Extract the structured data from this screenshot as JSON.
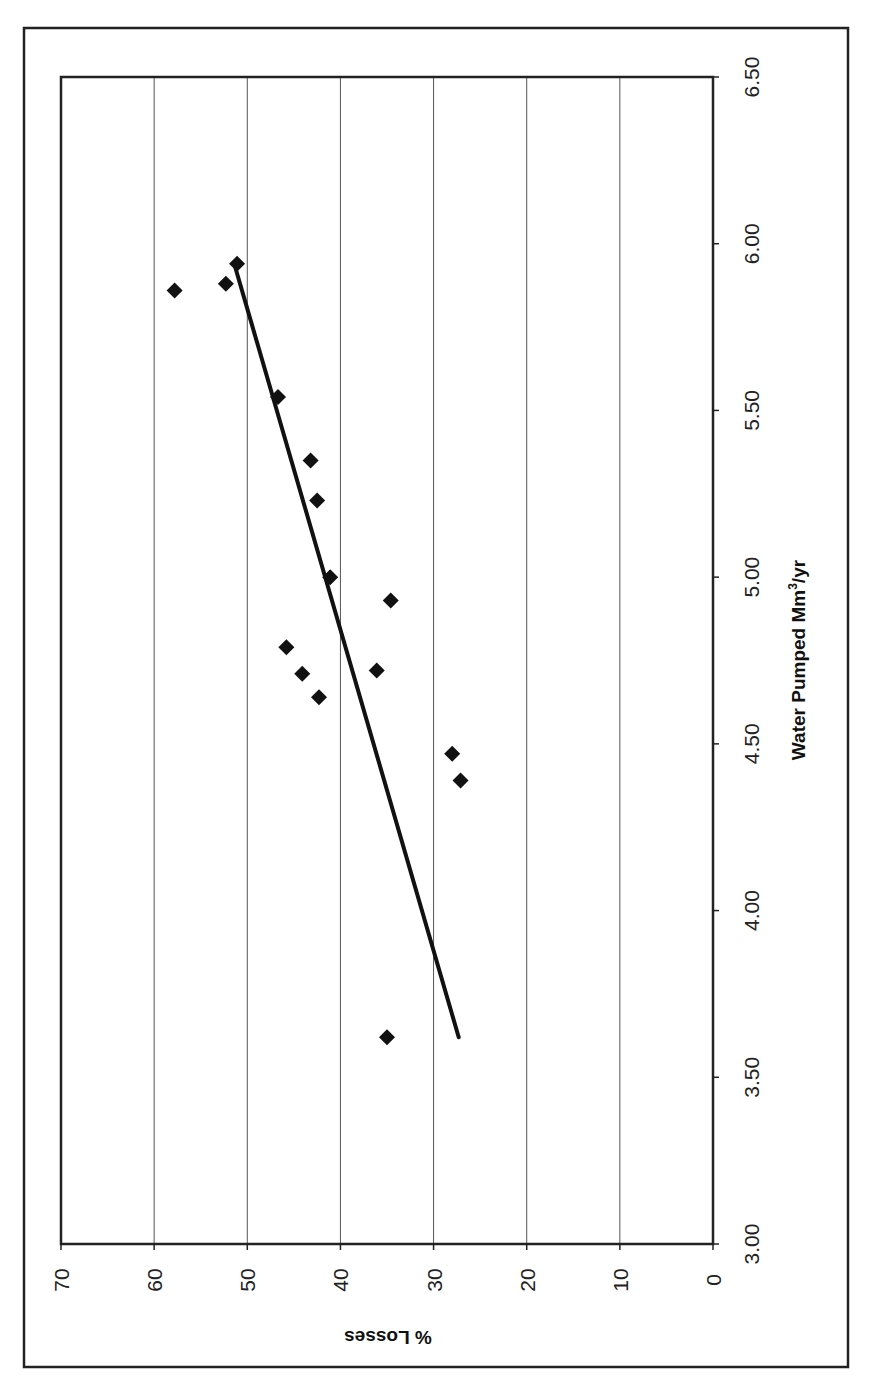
{
  "chart_data": {
    "type": "scatter",
    "orientation_note": "figure rotated 90 degrees counter-clockwise on page",
    "title": "",
    "xlabel": "Water Pumped Mm³/yr",
    "ylabel": "% Losses",
    "xlim": [
      3.0,
      6.5
    ],
    "ylim": [
      0,
      70
    ],
    "x_ticks": [
      "3.00",
      "3.50",
      "4.00",
      "4.50",
      "5.00",
      "5.50",
      "6.00",
      "6.50"
    ],
    "y_ticks": [
      "0",
      "10",
      "20",
      "30",
      "40",
      "50",
      "60",
      "70"
    ],
    "grid": {
      "y_major": true,
      "x_major": false
    },
    "legend": "none",
    "series": [
      {
        "name": "Observed",
        "marker": "diamond",
        "color": "#111111",
        "points": [
          {
            "x": 5.86,
            "y": 57.8
          },
          {
            "x": 5.88,
            "y": 52.3
          },
          {
            "x": 5.94,
            "y": 51.1
          },
          {
            "x": 5.54,
            "y": 46.7
          },
          {
            "x": 5.35,
            "y": 43.2
          },
          {
            "x": 5.23,
            "y": 42.5
          },
          {
            "x": 5.0,
            "y": 41.1
          },
          {
            "x": 4.93,
            "y": 34.6
          },
          {
            "x": 4.79,
            "y": 45.8
          },
          {
            "x": 4.71,
            "y": 44.1
          },
          {
            "x": 4.64,
            "y": 42.3
          },
          {
            "x": 4.72,
            "y": 36.1
          },
          {
            "x": 4.47,
            "y": 28.0
          },
          {
            "x": 4.39,
            "y": 27.1
          },
          {
            "x": 3.62,
            "y": 35.0
          }
        ]
      },
      {
        "name": "Linear trend",
        "type": "line",
        "color": "#111111",
        "points": [
          {
            "x": 3.62,
            "y": 27.3
          },
          {
            "x": 5.93,
            "y": 51.3
          }
        ]
      }
    ]
  },
  "labels": {
    "x_title_main": "Water Pumped Mm",
    "x_title_sup": "3",
    "x_title_tail": "/yr",
    "y_title": "% Losses"
  }
}
